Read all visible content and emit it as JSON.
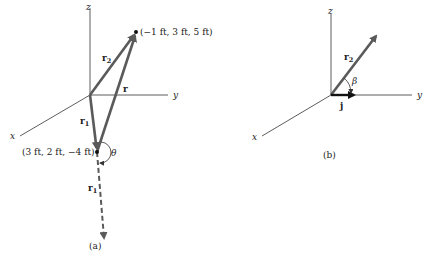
{
  "colors": {
    "vector": "#5a5a5a",
    "axis": "#333333",
    "text": "#222222",
    "background": "#ffffff"
  },
  "figure_a": {
    "caption": "(a)",
    "axes": {
      "x": "x",
      "y": "y",
      "z": "z"
    },
    "point_r2": "(−1 ft, 3 ft, 5 ft)",
    "point_r1": "(3 ft, 2 ft, −4 ft)",
    "vectors": {
      "r2": {
        "base": "r",
        "sub": "2"
      },
      "r": {
        "base": "r"
      },
      "r1": {
        "base": "r",
        "sub": "1"
      },
      "r1_extended": {
        "base": "r",
        "sub": "1"
      }
    },
    "angle": "θ"
  },
  "figure_b": {
    "caption": "(b)",
    "axes": {
      "x": "x",
      "y": "y",
      "z": "z"
    },
    "vectors": {
      "r2": {
        "base": "r",
        "sub": "2"
      },
      "j": {
        "base": "j"
      }
    },
    "angle": "β"
  }
}
